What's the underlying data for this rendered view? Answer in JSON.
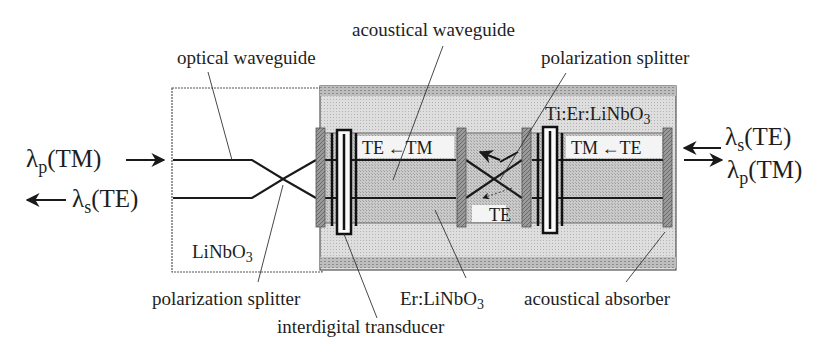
{
  "figure": {
    "type": "device schematic"
  },
  "io": {
    "left_in": {
      "symbol": "λ",
      "sub": "p",
      "mode": "(TM)",
      "direction": "in"
    },
    "left_out": {
      "symbol": "λ",
      "sub": "s",
      "mode": "(TE)",
      "direction": "out"
    },
    "right_top": {
      "symbol": "λ",
      "sub": "s",
      "mode": "(TE)",
      "direction": "out"
    },
    "right_bottom": {
      "symbol": "λ",
      "sub": "p",
      "mode": "(TM)",
      "direction": "in"
    }
  },
  "labels": {
    "optical_waveguide": "optical waveguide",
    "acoustical_waveguide": "acoustical waveguide",
    "polarization_splitter_top": "polarization splitter",
    "ti_er_linbo3_main": "Ti:Er:LiNbO",
    "ti_er_linbo3_sub": "3",
    "linbo3_main": "LiNbO",
    "linbo3_sub": "3",
    "polarization_splitter_bottom": "polarization splitter",
    "interdigital_transducer": "interdigital transducer",
    "er_linbo3_main": "Er:LiNbO",
    "er_linbo3_sub": "3",
    "acoustical_absorber": "acoustical absorber"
  },
  "mode_conversions": {
    "left_section": {
      "from": "TE",
      "arrow": "←",
      "to": "TM"
    },
    "right_section": {
      "from": "TM",
      "arrow": "←",
      "to": "TE"
    },
    "splitter_output": "TE"
  },
  "colors": {
    "outline": "#3a3a3a",
    "substrate_doped": "#d8d8d8",
    "acoustic_guide": "#c2c2c2",
    "absorber": "#8a8a8a",
    "line": "#1a1a1a"
  }
}
